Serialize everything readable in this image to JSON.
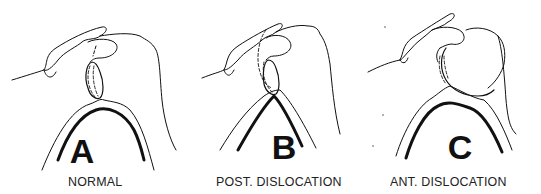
{
  "figure": {
    "type": "anatomical line diagram",
    "line_color": "#111111",
    "background": "#ffffff",
    "panels": [
      {
        "letter": "A",
        "caption": "NORMAL"
      },
      {
        "letter": "B",
        "caption": "POST.  DISLOCATION"
      },
      {
        "letter": "C",
        "caption": "ANT.  DISLOCATION"
      }
    ]
  }
}
